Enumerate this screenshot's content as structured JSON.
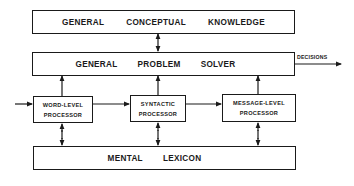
{
  "diagram": {
    "type": "block-diagram",
    "boxes": {
      "conceptual_knowledge": {
        "words": [
          "GENERAL",
          "CONCEPTUAL",
          "KNOWLEDGE"
        ]
      },
      "problem_solver": {
        "words": [
          "GENERAL",
          "PROBLEM",
          "SOLVER"
        ]
      },
      "word_level": {
        "line1": "WORD-LEVEL",
        "line2": "PROCESSOR"
      },
      "syntactic": {
        "line1": "SYNTACTIC",
        "line2": "PROCESSOR"
      },
      "message_level": {
        "line1": "MESSAGE-LEVEL",
        "line2": "PROCESSOR"
      },
      "mental_lexicon": {
        "words": [
          "MENTAL",
          "LEXICON"
        ]
      }
    },
    "output_label": "DECISIONS",
    "connections": [
      {
        "from": "conceptual_knowledge",
        "to": "problem_solver",
        "direction": "bidirectional"
      },
      {
        "from": "input",
        "to": "word_level",
        "direction": "forward"
      },
      {
        "from": "word_level",
        "to": "syntactic",
        "direction": "forward"
      },
      {
        "from": "syntactic",
        "to": "message_level",
        "direction": "forward"
      },
      {
        "from": "word_level",
        "to": "problem_solver",
        "direction": "forward"
      },
      {
        "from": "syntactic",
        "to": "problem_solver",
        "direction": "forward"
      },
      {
        "from": "message_level",
        "to": "problem_solver",
        "direction": "forward"
      },
      {
        "from": "word_level",
        "to": "mental_lexicon",
        "direction": "bidirectional"
      },
      {
        "from": "syntactic",
        "to": "mental_lexicon",
        "direction": "bidirectional"
      },
      {
        "from": "message_level",
        "to": "mental_lexicon",
        "direction": "bidirectional"
      },
      {
        "from": "problem_solver",
        "to": "decisions",
        "direction": "forward"
      }
    ],
    "colors": {
      "line": "#1a1a1a",
      "background": "#ffffff"
    }
  }
}
